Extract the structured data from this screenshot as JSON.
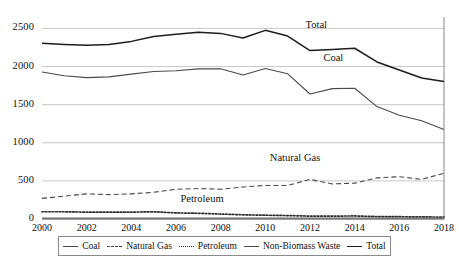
{
  "chart_data": {
    "type": "line",
    "title": "",
    "xlabel": "",
    "ylabel": "",
    "x": [
      2000,
      2001,
      2002,
      2003,
      2004,
      2005,
      2006,
      2007,
      2008,
      2009,
      2010,
      2011,
      2012,
      2013,
      2014,
      2015,
      2016,
      2017,
      2018
    ],
    "xticks": [
      "2000",
      "2002",
      "2004",
      "2006",
      "2008",
      "2010",
      "2012",
      "2014",
      "2016",
      "2018"
    ],
    "yticks": [
      "0",
      "500",
      "1000",
      "1500",
      "2000",
      "2500"
    ],
    "xlim": [
      2000,
      2018
    ],
    "ylim": [
      0,
      2650
    ],
    "grid": true,
    "legend_position": "bottom",
    "series": [
      {
        "name": "Coal",
        "style": "solid",
        "color": "#4a4a4a",
        "values": [
          1928,
          1880,
          1855,
          1865,
          1900,
          1935,
          1945,
          1970,
          1970,
          1890,
          1975,
          1905,
          1640,
          1710,
          1715,
          1475,
          1360,
          1290,
          1175
        ]
      },
      {
        "name": "Natural Gas",
        "style": "dashed",
        "color": "#4a4a4a",
        "values": [
          270,
          300,
          330,
          320,
          330,
          350,
          390,
          400,
          390,
          420,
          440,
          440,
          520,
          460,
          470,
          540,
          555,
          520,
          600
        ]
      },
      {
        "name": "Petroleum",
        "style": "dotted",
        "color": "#2b2b2b",
        "values": [
          95,
          95,
          90,
          90,
          90,
          95,
          80,
          75,
          65,
          55,
          50,
          45,
          38,
          38,
          40,
          32,
          30,
          28,
          25
        ]
      },
      {
        "name": "Non-Biomass Waste",
        "style": "solid",
        "color": "#6a6a6a",
        "values": [
          12,
          12,
          12,
          12,
          12,
          12,
          12,
          12,
          12,
          12,
          12,
          12,
          12,
          12,
          12,
          12,
          12,
          12,
          12
        ]
      },
      {
        "name": "Total",
        "style": "solid",
        "color": "#1d1d1d",
        "values": [
          2305,
          2290,
          2280,
          2290,
          2330,
          2395,
          2425,
          2450,
          2435,
          2375,
          2475,
          2400,
          2210,
          2225,
          2240,
          2060,
          1955,
          1850,
          1805
        ]
      }
    ],
    "annotations": [
      {
        "label": "Total",
        "x": 2011.8,
        "y": 2530
      },
      {
        "label": "Coal",
        "x": 2012.6,
        "y": 2105
      },
      {
        "label": "Natural Gas",
        "x": 2010.2,
        "y": 790
      },
      {
        "label": "Petroleum",
        "x": 2006.2,
        "y": 255
      }
    ]
  },
  "legend": {
    "items": [
      {
        "label": "Coal",
        "swatch": "solid-mid-line-icon"
      },
      {
        "label": "Natural Gas",
        "swatch": "dashed-line-icon"
      },
      {
        "label": "Petroleum",
        "swatch": "dotted-line-icon"
      },
      {
        "label": "Non-Biomass Waste",
        "swatch": "solid-mid-line-icon"
      },
      {
        "label": "Total",
        "swatch": "solid-dark-line-icon"
      }
    ]
  }
}
